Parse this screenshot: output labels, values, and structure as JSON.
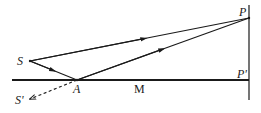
{
  "diagram": {
    "type": "optics-ray-diagram",
    "stroke_color": "#1a1a1a",
    "background": "#ffffff",
    "points": {
      "S": {
        "label": "S",
        "x": 30,
        "y": 61
      },
      "S_prime": {
        "label": "S'",
        "x": 28,
        "y": 100
      },
      "A": {
        "label": "A",
        "x": 77,
        "y": 80
      },
      "P": {
        "label": "P",
        "x": 249,
        "y": 18
      },
      "P_prime": {
        "label": "P'",
        "x": 249,
        "y": 80
      }
    },
    "mirror_label": "M",
    "lines": [
      {
        "from": "S",
        "to": "P",
        "style": "solid",
        "arrow": "toward P"
      },
      {
        "from": "S",
        "to": "A",
        "style": "solid",
        "arrow": "toward A"
      },
      {
        "from": "A",
        "to": "P",
        "style": "solid",
        "arrow": "toward P"
      },
      {
        "from": "A",
        "to": "S_prime",
        "style": "dashed",
        "arrow": "toward S'"
      },
      {
        "from": "mirror-left",
        "to": "P_prime",
        "style": "thick",
        "arrow": "none"
      },
      {
        "from": "screen-top",
        "to": "screen-bottom",
        "style": "solid",
        "arrow": "none"
      }
    ]
  }
}
